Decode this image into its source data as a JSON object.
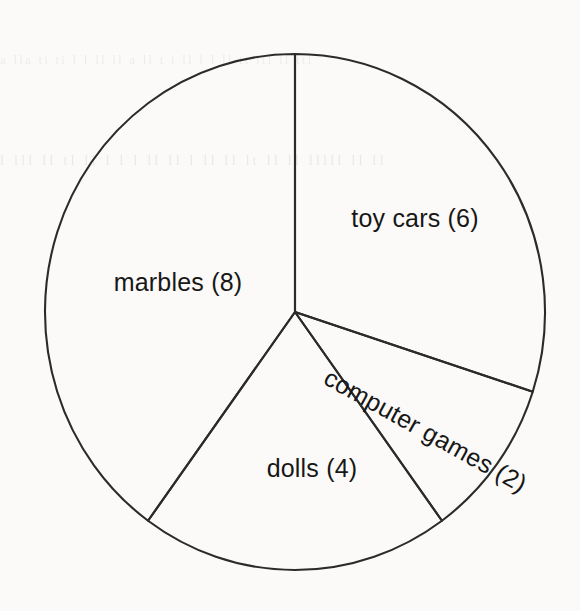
{
  "page": {
    "background_color": "#fbfaf8",
    "ink_color": "#2b2b2b",
    "text_color": "#171717",
    "ghost_text_1": "a    lla   ti    ti     l l ll ll a   ll  t   i  ll  l  l  ll tt  ltl  ll ttl",
    "ghost_text_2": "l  lll   ll  tl  ll  l   l l ll  ll   l ll  ll  lt  ll   ll  lllll  ll   ll"
  },
  "chart_data": {
    "type": "pie",
    "title": "",
    "subtitle": "",
    "xlabel": "",
    "ylabel": "",
    "legend_position": "none",
    "grid": false,
    "total": 20,
    "start_angle_deg": 0,
    "direction": "clockwise",
    "center": {
      "x": 295,
      "y": 312
    },
    "radius_x": 250,
    "radius_y": 258,
    "categories": [
      "toy cars",
      "computer games",
      "dolls",
      "marbles"
    ],
    "values": [
      6,
      2,
      4,
      8
    ],
    "slices": [
      {
        "name": "toy cars",
        "value": 6,
        "label": "toy cars (6)",
        "angle_deg": 108,
        "percent": 30,
        "label_x": 415,
        "label_y": 227,
        "label_rotation_deg": 0,
        "label_anchor": "middle"
      },
      {
        "name": "computer games",
        "value": 2,
        "label": "computer games (2)",
        "angle_deg": 36,
        "percent": 10,
        "label_x": 322,
        "label_y": 383,
        "label_rotation_deg": 29,
        "label_anchor": "start"
      },
      {
        "name": "dolls",
        "value": 4,
        "label": "dolls (4)",
        "angle_deg": 72,
        "percent": 20,
        "label_x": 312,
        "label_y": 477,
        "label_rotation_deg": 0,
        "label_anchor": "middle"
      },
      {
        "name": "marbles",
        "value": 8,
        "label": "marbles (8)",
        "angle_deg": 144,
        "percent": 40,
        "label_x": 178,
        "label_y": 291,
        "label_rotation_deg": 0,
        "label_anchor": "middle"
      }
    ]
  }
}
